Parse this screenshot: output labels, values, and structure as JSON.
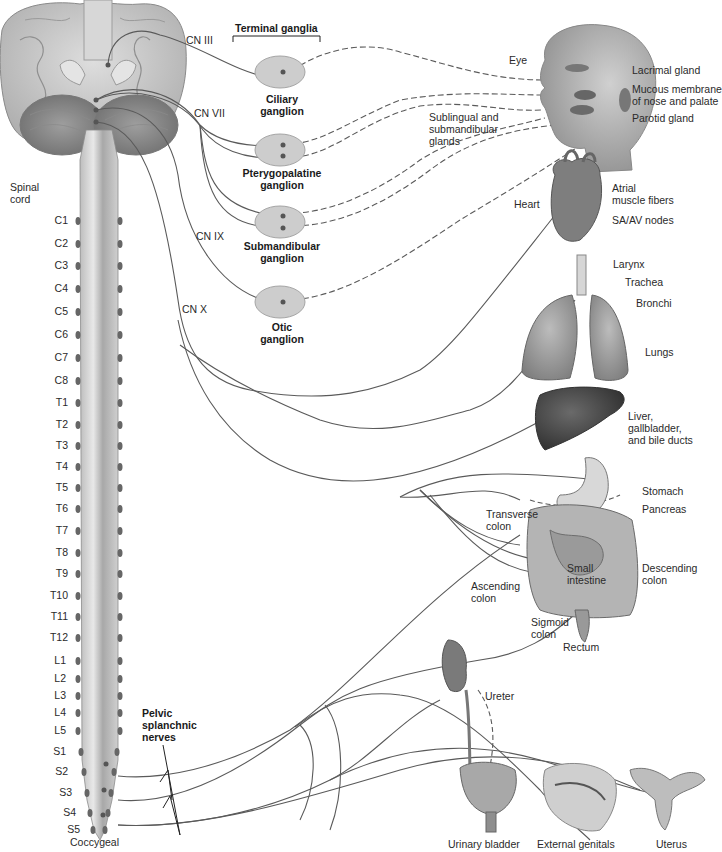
{
  "header": {
    "terminal_ganglia": "Terminal ganglia"
  },
  "cranial_nerves": [
    {
      "id": "cn3",
      "label": "CN III"
    },
    {
      "id": "cn7",
      "label": "CN VII"
    },
    {
      "id": "cn9",
      "label": "CN IX"
    },
    {
      "id": "cn10",
      "label": "CN X"
    }
  ],
  "ganglia": [
    {
      "id": "ciliary",
      "label": "Ciliary\nganglion"
    },
    {
      "id": "pterygopalatine",
      "label": "Pterygopalatine\nganglion"
    },
    {
      "id": "submandibular",
      "label": "Submandibular\nganglion"
    },
    {
      "id": "otic",
      "label": "Otic\nganglion"
    }
  ],
  "spinal": {
    "label": "Spinal\ncord",
    "segments": [
      "C1",
      "C2",
      "C3",
      "C4",
      "C5",
      "C6",
      "C7",
      "C8",
      "T1",
      "T2",
      "T3",
      "T4",
      "T5",
      "T6",
      "T7",
      "T8",
      "T9",
      "T10",
      "T11",
      "T12",
      "L1",
      "L2",
      "L3",
      "L4",
      "L5",
      "S1",
      "S2",
      "S3",
      "S4",
      "S5"
    ],
    "coccygeal": "Coccygeal",
    "pelvic_splanchnic": "Pelvic\nsplanchnic\nnerves"
  },
  "head_targets": {
    "eye": "Eye",
    "lacrimal": "Lacrimal gland",
    "mucous": "Mucous membrane\nof nose and palate",
    "parotid": "Parotid gland",
    "sublingual": "Sublingual and\nsubmandibular\nglands"
  },
  "thoracic_targets": {
    "heart": "Heart",
    "atrial": "Atrial\nmuscle fibers",
    "sa_av": "SA/AV nodes",
    "larynx": "Larynx",
    "trachea": "Trachea",
    "bronchi": "Bronchi",
    "lungs": "Lungs"
  },
  "abdominal_targets": {
    "liver": "Liver,\ngallbladder,\nand bile ducts",
    "stomach": "Stomach",
    "pancreas": "Pancreas",
    "transverse_colon": "Transverse\ncolon",
    "small_intestine": "Small\nintestine",
    "descending_colon": "Descending\ncolon",
    "ascending_colon": "Ascending\ncolon",
    "sigmoid_colon": "Sigmoid\ncolon",
    "rectum": "Rectum"
  },
  "pelvic_targets": {
    "ureter": "Ureter",
    "bladder": "Urinary bladder",
    "genitals": "External genitals",
    "uterus": "Uterus"
  },
  "colors": {
    "nerve": "#5a5a5a",
    "ganglion_fill": "#cfcfcf",
    "organ_dark": "#4a4a4a",
    "organ_mid": "#9a9a9a",
    "organ_light": "#d8d8d8",
    "brain": "#c9c9c9"
  }
}
